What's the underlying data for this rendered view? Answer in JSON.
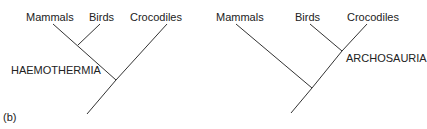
{
  "panel_label": "(b)",
  "trees": [
    {
      "name": "haemothermia-tree",
      "taxa": [
        "Mammals",
        "Birds",
        "Crocodiles"
      ],
      "clade_label": "HAEMOTHERMIA",
      "grouping": "(Mammals, Birds), Crocodiles"
    },
    {
      "name": "archosauria-tree",
      "taxa": [
        "Mammals",
        "Birds",
        "Crocodiles"
      ],
      "clade_label": "ARCHOSAURIA",
      "grouping": "Mammals, (Birds, Crocodiles)"
    }
  ],
  "colors": {
    "line": "#333333",
    "text": "#222222",
    "background": "#ffffff"
  }
}
